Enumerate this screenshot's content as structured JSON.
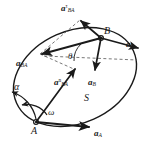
{
  "figure": {
    "body_label": "S",
    "colors": {
      "stroke": "#1a1a1a",
      "background": "#ffffff",
      "dashed": "#4a4a4a"
    }
  },
  "points": [
    {
      "name": "A",
      "label": "A",
      "x": 36,
      "y": 122
    },
    {
      "name": "B",
      "label": "B",
      "x": 101,
      "y": 38
    }
  ],
  "angles": [
    {
      "name": "theta",
      "label": "θ",
      "x": 70,
      "y": 56
    },
    {
      "name": "alpha",
      "label": "α",
      "x": 16,
      "y": 86
    },
    {
      "name": "omega",
      "label": "ω",
      "x": 49,
      "y": 112
    }
  ],
  "vectors": [
    {
      "name": "a-A-at-B",
      "base": "a",
      "sub": "A",
      "sup": "",
      "label_x": 129,
      "label_y": 44,
      "from": [
        101,
        38
      ],
      "to": [
        140,
        49
      ]
    },
    {
      "name": "a-B",
      "base": "a",
      "sub": "B",
      "sup": "",
      "label_x": 90,
      "label_y": 83,
      "from": [
        101,
        38
      ],
      "to": [
        95,
        72
      ]
    },
    {
      "name": "a-BA-relative",
      "base": "a",
      "sub": "BA",
      "sup": "",
      "label_x": 18,
      "label_y": 63,
      "from": [
        101,
        38
      ],
      "to": [
        40,
        54
      ]
    },
    {
      "name": "a-BA-tangential",
      "base": "a",
      "sub": "BA",
      "sup": "τ",
      "label_x": 62,
      "label_y": 6,
      "from": [
        101,
        38
      ],
      "to": [
        80,
        20
      ]
    },
    {
      "name": "a-BA-normal",
      "base": "a",
      "sub": "BA",
      "sup": "n",
      "label_x": 55,
      "label_y": 80,
      "from": [
        36,
        122
      ],
      "to": [
        76,
        70
      ]
    },
    {
      "name": "a-A-at-A",
      "base": "a",
      "sub": "A",
      "sup": "",
      "label_x": 96,
      "label_y": 132,
      "from": [
        36,
        122
      ],
      "to": [
        90,
        128
      ]
    }
  ]
}
